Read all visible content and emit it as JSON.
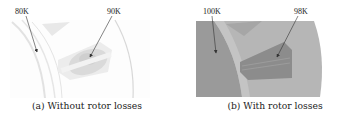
{
  "figure": {
    "panels": [
      {
        "id": "a",
        "caption": "(a) Without rotor losses",
        "annotations": [
          {
            "label": "80K",
            "target": "rotor-edge"
          },
          {
            "label": "90K",
            "target": "coil"
          }
        ]
      },
      {
        "id": "b",
        "caption": "(b) With rotor losses",
        "annotations": [
          {
            "label": "100K",
            "target": "rotor"
          },
          {
            "label": "98K",
            "target": "coil"
          }
        ]
      }
    ]
  },
  "colors": {
    "panel_a_background": "#fbfbfb",
    "panel_a_coil": "#d6d6d6",
    "panel_b_background": "#b4b4b4",
    "panel_b_rotor": "#989898",
    "panel_b_coil": "#8a8a8a",
    "arrow": "#333333"
  }
}
